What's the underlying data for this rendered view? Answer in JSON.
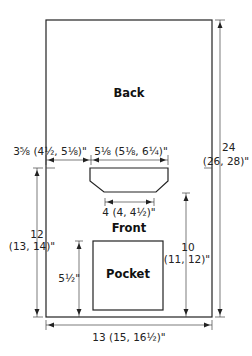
{
  "diagram": {
    "type": "sweater schematic",
    "pieces": {
      "back_label": "Back",
      "front_label": "Front",
      "pocket_label": "Pocket"
    },
    "dimensions": {
      "length": {
        "line1": "24",
        "line2": "(26, 28)\""
      },
      "shoulder_width": "3⅝ (4½, 5⅛)\"",
      "neck_width": "5⅛ (5⅛, 6¼)\"",
      "neck_bottom_width": "4 (4, 4½)\"",
      "front_height": {
        "line1": "12",
        "line2": "(13, 14)\""
      },
      "pocket_to_neck_height": {
        "line1": "10",
        "line2": "(11, 12)\""
      },
      "pocket_height": "5½\"",
      "width": "13 (15, 16½)\""
    }
  }
}
